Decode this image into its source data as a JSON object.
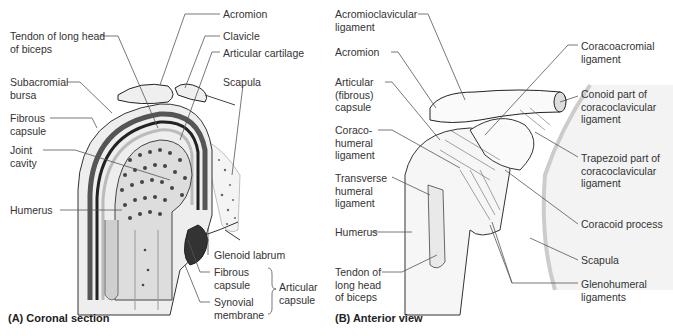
{
  "panel_a": {
    "caption": "(A) Coronal section",
    "labels": {
      "acromion": "Acromion",
      "tendon_long_head_biceps": "Tendon of long head\nof biceps",
      "clavicle": "Clavicle",
      "articular_cartilage": "Articular cartilage",
      "subacromial_bursa": "Subacromial\nbursa",
      "scapula": "Scapula",
      "fibrous_capsule": "Fibrous\ncapsule",
      "joint_cavity": "Joint\ncavity",
      "humerus": "Humerus",
      "glenoid_labrum": "Glenoid labrum",
      "fibrous_capsule_2": "Fibrous\ncapsule",
      "synovial_membrane": "Synovial\nmembrane",
      "articular_capsule": "Articular\ncapsule"
    }
  },
  "panel_b": {
    "caption": "(B) Anterior view",
    "labels": {
      "acromioclavicular_ligament": "Acromioclavicular\nligament",
      "acromion": "Acromion",
      "coracoacromial_ligament": "Coracoacromial\nligament",
      "articular_fibrous_capsule": "Articular\n(fibrous)\ncapsule",
      "conoid_part": "Conoid part of\ncoracoclavicular\nligament",
      "coracohumeral_ligament": "Coraco-\nhumeral\nligament",
      "trapezoid_part": "Trapezoid part of\ncoracoclavicular\nligament",
      "transverse_humeral_ligament": "Transverse\nhumeral\nligament",
      "coracoid_process": "Coracoid process",
      "humerus": "Humerus",
      "scapula": "Scapula",
      "tendon_long_head_biceps": "Tendon of\nlong head\nof biceps",
      "glenohumeral_ligaments": "Glenohumeral\nligaments"
    }
  }
}
